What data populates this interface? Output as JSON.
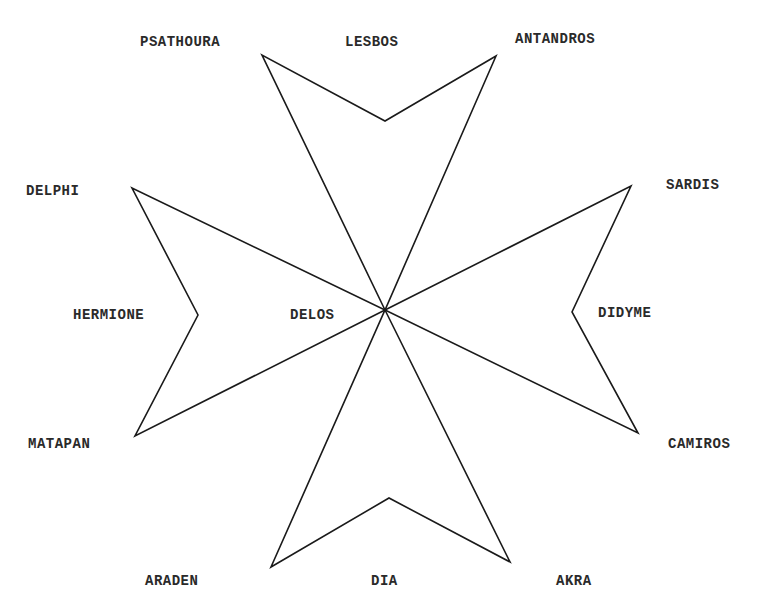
{
  "diagram": {
    "type": "maltese-cross",
    "stroke_color": "#1a1a1a",
    "background": "#ffffff",
    "center": {
      "id": "delos",
      "label": "DELOS"
    },
    "arms": [
      {
        "name": "north",
        "vertices": [
          {
            "id": "psathoura",
            "label": "PSATHOURA",
            "role": "tip"
          },
          {
            "id": "lesbos",
            "label": "LESBOS",
            "role": "notch"
          },
          {
            "id": "antandros",
            "label": "ANTANDROS",
            "role": "tip"
          }
        ]
      },
      {
        "name": "east",
        "vertices": [
          {
            "id": "sardis",
            "label": "SARDIS",
            "role": "tip"
          },
          {
            "id": "didyme",
            "label": "DIDYME",
            "role": "notch"
          },
          {
            "id": "camiros",
            "label": "CAMIROS",
            "role": "tip"
          }
        ]
      },
      {
        "name": "south",
        "vertices": [
          {
            "id": "akra",
            "label": "AKRA",
            "role": "tip"
          },
          {
            "id": "dia",
            "label": "DIA",
            "role": "notch"
          },
          {
            "id": "araden",
            "label": "ARADEN",
            "role": "tip"
          }
        ]
      },
      {
        "name": "west",
        "vertices": [
          {
            "id": "matapan",
            "label": "MATAPAN",
            "role": "tip"
          },
          {
            "id": "hermione",
            "label": "HERMIONE",
            "role": "notch"
          },
          {
            "id": "delphi",
            "label": "DELPHI",
            "role": "tip"
          }
        ]
      }
    ]
  },
  "labels": {
    "psathoura": "PSATHOURA",
    "lesbos": "LESBOS",
    "antandros": "ANTANDROS",
    "delphi": "DELPHI",
    "sardis": "SARDIS",
    "hermione": "HERMIONE",
    "delos": "DELOS",
    "didyme": "DIDYME",
    "matapan": "MATAPAN",
    "camiros": "CAMIROS",
    "araden": "ARADEN",
    "dia": "DIA",
    "akra": "AKRA"
  }
}
